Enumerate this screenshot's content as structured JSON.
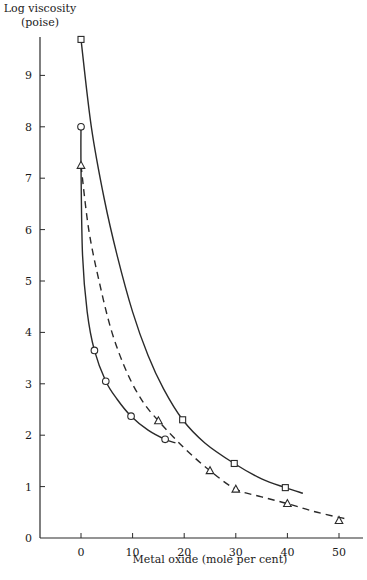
{
  "chart_data": {
    "type": "line",
    "title": "",
    "xlabel": "Metal oxide (mole per cent)",
    "ylabel": "Log viscosity (poise)",
    "ylabel_line1": "Log viscosity",
    "ylabel_line2": "(poise)",
    "xlim": [
      -8,
      53
    ],
    "ylim": [
      0,
      10
    ],
    "xticks": [
      0,
      10,
      20,
      30,
      40,
      50
    ],
    "yticks": [
      0,
      1,
      2,
      3,
      4,
      5,
      6,
      7,
      8,
      9
    ],
    "grid": false,
    "legend": "none",
    "series": [
      {
        "name": "circles",
        "marker": "circle",
        "line_style": "solid",
        "x": [
          0,
          2.6,
          4.8,
          9.7,
          16.3
        ],
        "y": [
          8.0,
          3.65,
          3.05,
          2.37,
          1.92
        ],
        "curve": [
          [
            0,
            8.0
          ],
          [
            0,
            7.25
          ],
          [
            0.3,
            5.5
          ],
          [
            1.2,
            4.4
          ],
          [
            2.6,
            3.65
          ],
          [
            4.8,
            3.05
          ],
          [
            7,
            2.7
          ],
          [
            9.7,
            2.37
          ],
          [
            13,
            2.1
          ],
          [
            16.3,
            1.92
          ],
          [
            18.3,
            1.85
          ]
        ]
      },
      {
        "name": "triangles",
        "marker": "triangle",
        "line_style": "dashed",
        "x": [
          0,
          15,
          25,
          30,
          40,
          50
        ],
        "y": [
          7.25,
          2.28,
          1.31,
          0.95,
          0.67,
          0.34
        ],
        "curve": [
          [
            0,
            7.25
          ],
          [
            1.5,
            6.0
          ],
          [
            3.5,
            5.0
          ],
          [
            6,
            4.0
          ],
          [
            9,
            3.2
          ],
          [
            12,
            2.65
          ],
          [
            15,
            2.28
          ],
          [
            20,
            1.75
          ],
          [
            25,
            1.31
          ],
          [
            30,
            0.95
          ],
          [
            35,
            0.8
          ],
          [
            40,
            0.67
          ],
          [
            45,
            0.52
          ],
          [
            50,
            0.4
          ],
          [
            51.7,
            0.37
          ]
        ]
      },
      {
        "name": "squares",
        "marker": "square",
        "line_style": "solid",
        "x": [
          0,
          19.7,
          29.7,
          39.6
        ],
        "y": [
          9.7,
          2.3,
          1.45,
          0.98
        ],
        "curve": [
          [
            0,
            9.7
          ],
          [
            2,
            8.0
          ],
          [
            4.5,
            6.6
          ],
          [
            7,
            5.5
          ],
          [
            10,
            4.4
          ],
          [
            13,
            3.55
          ],
          [
            16,
            2.9
          ],
          [
            19.7,
            2.3
          ],
          [
            24,
            1.85
          ],
          [
            29.7,
            1.45
          ],
          [
            35,
            1.15
          ],
          [
            39.6,
            0.98
          ],
          [
            43,
            0.87
          ]
        ]
      }
    ]
  }
}
